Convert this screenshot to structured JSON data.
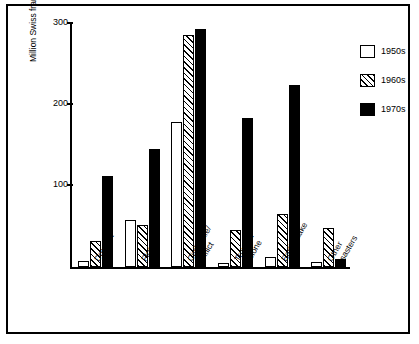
{
  "chart_data": {
    "type": "bar",
    "title": "",
    "xlabel": "",
    "ylabel": "Million Swiss francs",
    "ylim": [
      0,
      300
    ],
    "yticks": [
      100,
      200,
      300
    ],
    "grid": false,
    "legend_position": "right-top",
    "categories": [
      "Drought",
      "Flood",
      "Civil strife/\nconflict",
      "Tropical\ncyclone",
      "Earthquake",
      "Other\ndisasters"
    ],
    "category_labels": [
      {
        "line1": "Drought",
        "line2": ""
      },
      {
        "line1": "Flood",
        "line2": ""
      },
      {
        "line1": "Civil strife/",
        "line2": "conflict"
      },
      {
        "line1": "Tropical",
        "line2": "cyclone"
      },
      {
        "line1": "Earthquake",
        "line2": ""
      },
      {
        "line1": "Other",
        "line2": "disasters"
      }
    ],
    "series": [
      {
        "name": "1950s",
        "fill": "white",
        "values": [
          7,
          57,
          177,
          5,
          12,
          6
        ]
      },
      {
        "name": "1960s",
        "fill": "hatched",
        "values": [
          32,
          51,
          284,
          45,
          65,
          48
        ]
      },
      {
        "name": "1970s",
        "fill": "black",
        "values": [
          112,
          144,
          292,
          182,
          223,
          10
        ]
      }
    ]
  },
  "legend": {
    "items": [
      {
        "label": "1950s"
      },
      {
        "label": "1960s"
      },
      {
        "label": "1970s"
      }
    ]
  },
  "axis": {
    "y_title": "Million Swiss francs",
    "y_ticks": [
      "100",
      "200",
      "300"
    ]
  }
}
